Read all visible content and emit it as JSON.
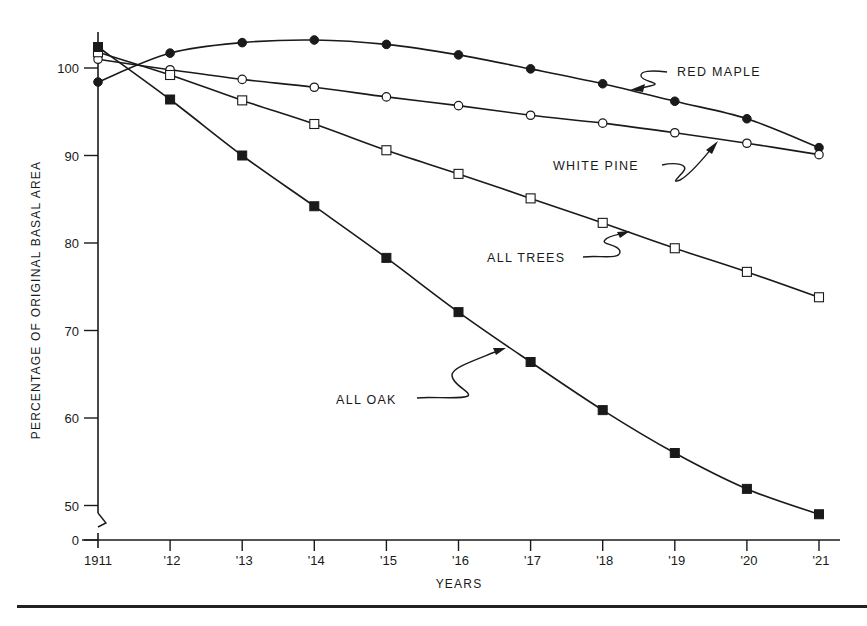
{
  "chart_data": {
    "type": "line",
    "title": "",
    "xlabel": "YEARS",
    "ylabel": "PERCENTAGE OF ORIGINAL BASAL AREA",
    "categories": [
      "1911",
      "'12",
      "'13",
      "'14",
      "'15",
      "'16",
      "'17",
      "'18",
      "'19",
      "'20",
      "'21"
    ],
    "x": [
      1911,
      1912,
      1913,
      1914,
      1915,
      1916,
      1917,
      1918,
      1919,
      1920,
      1921
    ],
    "y_ticks": [
      0,
      50,
      60,
      70,
      80,
      90,
      100
    ],
    "y_axis_break": "between 0 and 50",
    "ylim": [
      45,
      104
    ],
    "grid": false,
    "legend_position": "inline labels with curved arrows",
    "series": [
      {
        "name": "RED MAPLE",
        "marker": "filled-circle",
        "values": [
          98.4,
          101.7,
          102.9,
          103.2,
          102.7,
          101.5,
          99.9,
          98.2,
          96.2,
          94.2,
          90.9
        ]
      },
      {
        "name": "WHITE PINE",
        "marker": "open-circle",
        "values": [
          101.0,
          99.8,
          98.7,
          97.8,
          96.7,
          95.7,
          94.6,
          93.7,
          92.6,
          91.4,
          90.1
        ]
      },
      {
        "name": "ALL TREES",
        "marker": "open-square",
        "values": [
          101.8,
          99.2,
          96.3,
          93.6,
          90.6,
          87.9,
          85.1,
          82.3,
          79.4,
          76.7,
          73.8
        ]
      },
      {
        "name": "ALL OAK",
        "marker": "filled-square",
        "values": [
          102.4,
          96.4,
          90.0,
          84.2,
          78.3,
          72.1,
          66.4,
          60.9,
          56.0,
          51.9,
          49.0
        ]
      }
    ]
  },
  "labels": {
    "red_maple": "RED MAPLE",
    "white_pine": "WHITE PINE",
    "all_trees": "ALL TREES",
    "all_oak": "ALL OAK",
    "x_title": "YEARS",
    "y_title": "PERCENTAGE OF ORIGINAL BASAL AREA"
  },
  "colors": {
    "ink": "#1a1a1a",
    "background": "#ffffff"
  }
}
